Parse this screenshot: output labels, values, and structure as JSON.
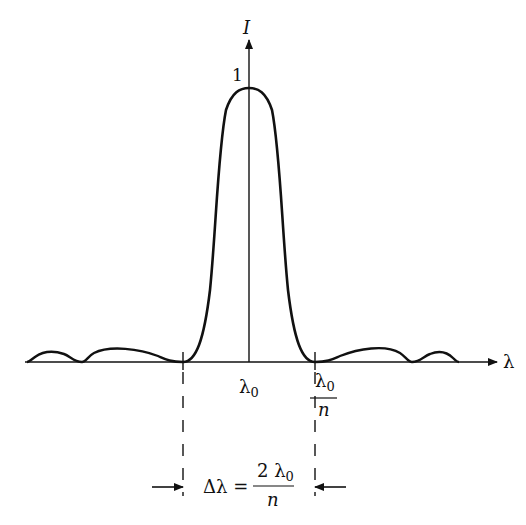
{
  "diagram": {
    "type": "intensity-profile",
    "axes": {
      "y_label": "I",
      "x_label": "λ",
      "peak_value_label": "1"
    },
    "ticks": {
      "center_label": "λ",
      "center_subscript": "0",
      "right_numerator": "λ",
      "right_numerator_subscript": "0",
      "right_denominator": "n"
    },
    "width_annotation": {
      "lhs": "Δλ =",
      "numerator": "2 λ",
      "numerator_subscript": "0",
      "denominator": "n"
    },
    "colors": {
      "stroke": "#111111",
      "background": "#ffffff"
    }
  }
}
